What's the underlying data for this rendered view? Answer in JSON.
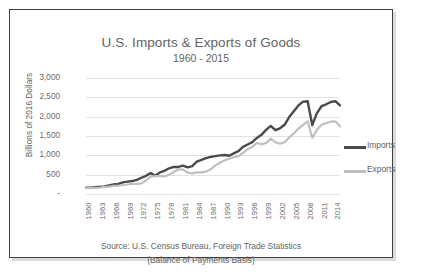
{
  "chart_data": {
    "type": "line",
    "title": "U.S. Imports & Exports of Goods",
    "subtitle": "1960 - 2015",
    "ylabel": "Billions of 2016 Dollars",
    "xlabel": "",
    "ylim": [
      0,
      3000
    ],
    "ytick_labels": [
      "3,000",
      "2,500",
      "2,000",
      "1,500",
      "1,000",
      "500",
      "-"
    ],
    "ytick_values": [
      3000,
      2500,
      2000,
      1500,
      1000,
      500,
      0
    ],
    "grid": true,
    "legend_position": "right",
    "xtick_labels": [
      "1960",
      "1963",
      "1966",
      "1969",
      "1972",
      "1975",
      "1978",
      "1981",
      "1984",
      "1987",
      "1990",
      "1993",
      "1996",
      "1999",
      "2002",
      "2005",
      "2008",
      "2011",
      "2014"
    ],
    "x": [
      1960,
      1961,
      1962,
      1963,
      1964,
      1965,
      1966,
      1967,
      1968,
      1969,
      1970,
      1971,
      1972,
      1973,
      1974,
      1975,
      1976,
      1977,
      1978,
      1979,
      1980,
      1981,
      1982,
      1983,
      1984,
      1985,
      1986,
      1987,
      1988,
      1989,
      1990,
      1991,
      1992,
      1993,
      1994,
      1995,
      1996,
      1997,
      1998,
      1999,
      2000,
      2001,
      2002,
      2003,
      2004,
      2005,
      2006,
      2007,
      2008,
      2009,
      2010,
      2011,
      2012,
      2013,
      2014,
      2015
    ],
    "series": [
      {
        "name": "Imports",
        "color": "#4a4a4a",
        "width": 2.4,
        "values": [
          160,
          165,
          178,
          186,
          198,
          220,
          250,
          262,
          300,
          320,
          335,
          365,
          420,
          470,
          545,
          470,
          560,
          600,
          665,
          700,
          700,
          735,
          690,
          720,
          840,
          880,
          930,
          960,
          980,
          1000,
          1010,
          990,
          1050,
          1110,
          1220,
          1280,
          1340,
          1450,
          1530,
          1660,
          1760,
          1650,
          1700,
          1790,
          1990,
          2140,
          2290,
          2390,
          2400,
          1780,
          2090,
          2270,
          2320,
          2380,
          2400,
          2290
        ]
      },
      {
        "name": "Exports",
        "color": "#bfbfbf",
        "width": 2.2,
        "values": [
          150,
          152,
          158,
          168,
          186,
          192,
          208,
          214,
          232,
          245,
          266,
          258,
          275,
          350,
          450,
          460,
          465,
          455,
          500,
          570,
          640,
          630,
          560,
          530,
          560,
          560,
          580,
          640,
          740,
          810,
          870,
          910,
          950,
          980,
          1060,
          1160,
          1220,
          1320,
          1290,
          1320,
          1430,
          1340,
          1300,
          1340,
          1460,
          1570,
          1690,
          1790,
          1880,
          1450,
          1660,
          1790,
          1830,
          1870,
          1880,
          1750
        ]
      }
    ],
    "source_line1": "Source: U.S. Census Bureau, Foreign Trade Statistics",
    "source_line2": "(Balance of Payments Basis)"
  }
}
